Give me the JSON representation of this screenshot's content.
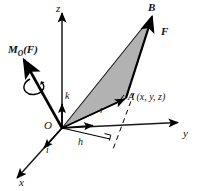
{
  "figure": {
    "type": "vector-diagram",
    "title_text": "",
    "background_color": "#ffffff",
    "stroke_color": "#000000",
    "triangle_fill": "#b4b4b4",
    "width": 198,
    "height": 191
  },
  "axes": [
    {
      "name": "z-axis",
      "label": "z",
      "direction": "up",
      "origin": [
        62,
        128
      ],
      "tip": [
        62,
        12
      ]
    },
    {
      "name": "y-axis",
      "label": "y",
      "direction": "right",
      "origin": [
        62,
        128
      ],
      "tip": [
        180,
        122
      ]
    },
    {
      "name": "x-axis",
      "label": "x",
      "direction": "down-left",
      "origin": [
        62,
        128
      ],
      "tip": [
        16,
        179
      ]
    }
  ],
  "points": [
    {
      "name": "origin",
      "label": "O",
      "at": [
        62,
        128
      ]
    },
    {
      "name": "point-a",
      "label": "A (x, y, z)",
      "at": [
        125,
        98
      ]
    },
    {
      "name": "point-b",
      "label": "B",
      "at": [
        152,
        13
      ]
    }
  ],
  "vectors": [
    {
      "name": "moment-vector",
      "label": "M",
      "subscript": "O",
      "argument": "(F)",
      "bold": true,
      "from": [
        62,
        128
      ],
      "to": [
        23,
        59
      ]
    },
    {
      "name": "force-vector",
      "label": "F",
      "bold": true,
      "from": [
        125,
        98
      ],
      "to": [
        152,
        16
      ]
    },
    {
      "name": "position-vector",
      "label": "r",
      "bold": false,
      "from": [
        62,
        128
      ],
      "to": [
        125,
        98
      ]
    },
    {
      "name": "unit-vector-i",
      "label": "i",
      "bold": false,
      "from": [
        62,
        128
      ],
      "to": [
        45,
        147
      ]
    },
    {
      "name": "unit-vector-j",
      "label": "j",
      "bold": false,
      "from": [
        62,
        128
      ],
      "to": [
        95,
        124
      ]
    },
    {
      "name": "unit-vector-k",
      "label": "k",
      "bold": false,
      "from": [
        62,
        128
      ],
      "to": [
        62,
        103
      ]
    }
  ],
  "measures": [
    {
      "name": "moment-arm",
      "label": "h",
      "from": [
        62,
        128
      ],
      "to": [
        108,
        136
      ],
      "note": "perpendicular distance"
    }
  ],
  "annotations": {
    "right_angle_marker": {
      "name": "right-angle-marker",
      "at": [
        108,
        134
      ]
    },
    "rotation_arc": {
      "name": "rotation-arc",
      "about": "moment-vector"
    },
    "shaded_triangle": {
      "name": "moment-plane-triangle",
      "vertices": [
        [
          62,
          128
        ],
        [
          125,
          98
        ],
        [
          152,
          16
        ]
      ]
    },
    "dashed_lines": [
      {
        "name": "dashed-line-a-to-plane",
        "from": [
          132,
          95
        ],
        "to": [
          113,
          152
        ]
      },
      {
        "name": "dashed-line-f-extension",
        "from": [
          146,
          108
        ],
        "to": [
          178,
          70
        ]
      }
    ]
  },
  "labels": {
    "moment": {
      "base": "M",
      "sub": "O",
      "arg": "(F)"
    },
    "force": "F",
    "position": "r",
    "moment_arm": "h",
    "origin": "O",
    "point_a": "A (x, y, z)",
    "point_b": "B",
    "unit_i": "i",
    "unit_j": "j",
    "unit_k": "k",
    "axis_x": "x",
    "axis_y": "y",
    "axis_z": "z"
  }
}
